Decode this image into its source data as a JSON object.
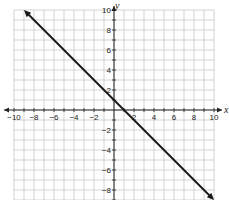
{
  "chart_data": {
    "type": "line",
    "title": "",
    "xlabel": "x",
    "ylabel": "y",
    "xlim": [
      -10,
      10
    ],
    "ylim": [
      -9.5,
      10
    ],
    "grid": true,
    "grid_step": 1,
    "x_tick_labels": [
      "-10",
      "-8",
      "-6",
      "-4",
      "-2",
      "2",
      "4",
      "6",
      "8",
      "10"
    ],
    "y_tick_labels": [
      "10",
      "8",
      "6",
      "4",
      "2",
      "-2",
      "-4",
      "-6",
      "-8"
    ],
    "series": [
      {
        "name": "line",
        "equation": "y = -x + 1",
        "x": [
          -9,
          10
        ],
        "y": [
          10,
          -9
        ],
        "arrows": "both",
        "color": "#1a1a1a"
      }
    ]
  },
  "colors": {
    "grid": "#c8c8c8",
    "axis": "#222222",
    "line": "#1a1a1a"
  }
}
